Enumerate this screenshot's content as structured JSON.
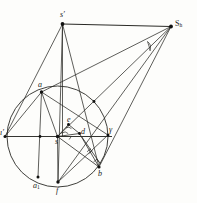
{
  "figure": {
    "kind": "geometric-construction",
    "width": 197,
    "height": 203,
    "background_color": "#fdfdfb",
    "stroke_color": "#262622",
    "label_color": "#1a1a18"
  },
  "labels": {
    "s_prime": "s′",
    "S_h": "S",
    "S_h_sub": "h",
    "a": "a",
    "a_one": "a",
    "a_one_sub": "1",
    "l_prime": "ı′",
    "gamma": "γ",
    "e": "e",
    "d": "d",
    "s": "s",
    "b": "b",
    "f": "f"
  },
  "points": [
    {
      "id": "s_prime",
      "label": "s′",
      "x": 62.5,
      "y": 24.0,
      "label_dx": -1.0,
      "label_dy": -12.0
    },
    {
      "id": "S_h",
      "label": "S",
      "x": 171.0,
      "y": 26.5,
      "label_dx": 4.0,
      "label_dy": -5.5
    },
    {
      "id": "a",
      "label": "a",
      "x": 41.5,
      "y": 92.0,
      "label_dx": -1.5,
      "label_dy": -9.5
    },
    {
      "id": "l_prime",
      "label": "ı′",
      "x": 5.0,
      "y": 136.5,
      "label_dx": -4.0,
      "label_dy": -6.0
    },
    {
      "id": "gamma",
      "label": "γ",
      "x": 108.0,
      "y": 135.0,
      "label_dx": 1.5,
      "label_dy": -8.5
    },
    {
      "id": "center",
      "label": "s",
      "x": 57.5,
      "y": 136.5,
      "label_dx": -1.0,
      "label_dy": 2.0
    },
    {
      "id": "e",
      "label": "e",
      "x": 68.5,
      "y": 124.5,
      "label_dx": -1.0,
      "label_dy": -7.5
    },
    {
      "id": "d",
      "label": "d",
      "x": 79.5,
      "y": 133.5,
      "label_dx": 1.0,
      "label_dy": -5.0
    },
    {
      "id": "b",
      "label": "b",
      "x": 99.0,
      "y": 167.0,
      "label_dx": -0.5,
      "label_dy": 6.5
    },
    {
      "id": "f",
      "label": "f",
      "x": 58.0,
      "y": 182.0,
      "label_dx": -1.0,
      "label_dy": 10.0
    },
    {
      "id": "a_one",
      "label": "a",
      "x": 38.0,
      "y": 177.0,
      "label_dx": -2.5,
      "label_dy": 9.0
    },
    {
      "id": "top_chord",
      "label": "",
      "x": 40.0,
      "y": 136.5,
      "label_dx": 0,
      "label_dy": 0
    },
    {
      "id": "arc_right",
      "label": "",
      "x": 94.0,
      "y": 101.5,
      "label_dx": 0,
      "label_dy": 0
    }
  ],
  "circle": {
    "cx": 57.5,
    "cy": 136.5,
    "r": 50.5,
    "label": "main-circle"
  },
  "segments": [
    {
      "name": "s-prime-to-Sh",
      "from": [
        62.5,
        24.0
      ],
      "to": [
        171.0,
        26.5
      ]
    },
    {
      "name": "s-prime-to-l-prime",
      "from": [
        62.5,
        24.0
      ],
      "to": [
        5.0,
        136.5
      ]
    },
    {
      "name": "s-prime-to-a",
      "from": [
        62.5,
        24.0
      ],
      "to": [
        41.5,
        92.0
      ]
    },
    {
      "name": "s-prime-to-f",
      "from": [
        62.5,
        24.0
      ],
      "to": [
        58.0,
        182.0
      ]
    },
    {
      "name": "s-prime-to-b",
      "from": [
        62.5,
        24.0
      ],
      "to": [
        99.0,
        167.0
      ]
    },
    {
      "name": "Sh-to-a",
      "from": [
        171.0,
        26.5
      ],
      "to": [
        41.5,
        92.0
      ]
    },
    {
      "name": "Sh-to-s-center",
      "from": [
        171.0,
        26.5
      ],
      "to": [
        57.5,
        136.5
      ]
    },
    {
      "name": "Sh-to-f",
      "from": [
        171.0,
        26.5
      ],
      "to": [
        58.0,
        182.0
      ]
    },
    {
      "name": "Sh-to-b",
      "from": [
        171.0,
        26.5
      ],
      "to": [
        99.0,
        167.0
      ]
    },
    {
      "name": "horizontal-diameter",
      "from": [
        5.0,
        136.5
      ],
      "to": [
        112.0,
        136.5
      ]
    },
    {
      "name": "a-to-a1-vertical",
      "from": [
        41.5,
        92.0
      ],
      "to": [
        38.0,
        177.0
      ]
    },
    {
      "name": "a-to-gamma",
      "from": [
        41.5,
        92.0
      ],
      "to": [
        108.0,
        135.0
      ]
    },
    {
      "name": "a-to-center",
      "from": [
        41.5,
        92.0
      ],
      "to": [
        57.5,
        136.5
      ]
    },
    {
      "name": "center-to-d",
      "from": [
        57.5,
        136.5
      ],
      "to": [
        79.5,
        133.5
      ]
    },
    {
      "name": "center-to-e",
      "from": [
        57.5,
        136.5
      ],
      "to": [
        68.5,
        124.5
      ]
    },
    {
      "name": "e-to-d",
      "from": [
        68.5,
        124.5
      ],
      "to": [
        79.5,
        133.5
      ]
    },
    {
      "name": "d-to-b",
      "from": [
        79.5,
        133.5
      ],
      "to": [
        99.0,
        167.0
      ]
    },
    {
      "name": "center-to-b",
      "from": [
        57.5,
        136.5
      ],
      "to": [
        99.0,
        167.0
      ]
    },
    {
      "name": "center-to-f",
      "from": [
        57.5,
        136.5
      ],
      "to": [
        58.0,
        182.0
      ]
    },
    {
      "name": "l-prime-to-a",
      "from": [
        5.0,
        136.5
      ],
      "to": [
        41.5,
        92.0
      ]
    },
    {
      "name": "f-to-gamma",
      "from": [
        58.0,
        182.0
      ],
      "to": [
        108.0,
        135.0
      ]
    },
    {
      "name": "vertical-s-prime-axis",
      "from": [
        62.5,
        24.0
      ],
      "to": [
        62.5,
        136.5
      ]
    }
  ],
  "markers": [
    {
      "name": "right-angle-at-b",
      "x": 95.0,
      "y": 160.0,
      "type": "square"
    },
    {
      "name": "angle-arc-at-Sh",
      "x": 150.0,
      "y": 44.0,
      "type": "arc"
    },
    {
      "name": "angle-arc-at-center",
      "x": 64.0,
      "y": 131.0,
      "type": "arc"
    },
    {
      "name": "tick-on-db",
      "x": 89.0,
      "y": 150.0,
      "type": "tick"
    },
    {
      "name": "tick-on-sd",
      "x": 70.0,
      "y": 141.0,
      "type": "tick"
    }
  ]
}
